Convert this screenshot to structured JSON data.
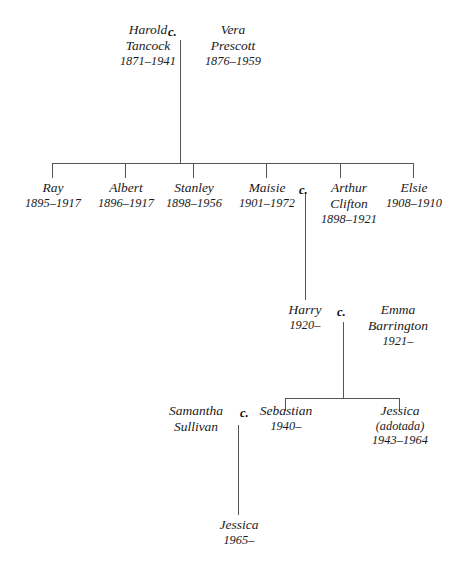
{
  "diagram": {
    "line_color": "#555555",
    "text_color": "#1a1a1a",
    "background": "#ffffff",
    "marriage_symbol": "c."
  },
  "generations": {
    "gen1": [
      {
        "name": "Harold",
        "surname": "Tancock",
        "dates": "1871–1941"
      },
      {
        "name": "Vera",
        "surname": "Prescott",
        "dates": "1876–1959"
      }
    ],
    "gen2": [
      {
        "name": "Ray",
        "dates": "1895–1917"
      },
      {
        "name": "Albert",
        "dates": "1896–1917"
      },
      {
        "name": "Stanley",
        "dates": "1898–1956"
      },
      {
        "name": "Maisie",
        "dates": "1901–1972"
      },
      {
        "name": "Arthur",
        "surname": "Clifton",
        "dates": "1898–1921"
      },
      {
        "name": "Elsie",
        "dates": "1908–1910"
      }
    ],
    "gen3": [
      {
        "name": "Harry",
        "dates": "1920–"
      },
      {
        "name": "Emma",
        "surname": "Barrington",
        "dates": "1921–"
      }
    ],
    "gen4": [
      {
        "name": "Samantha",
        "surname": "Sullivan",
        "dates": ""
      },
      {
        "name": "Sebastian",
        "dates": "1940–"
      },
      {
        "name": "Jessica",
        "note": "(adotada)",
        "dates": "1943–1964"
      }
    ],
    "gen5": [
      {
        "name": "Jessica",
        "dates": "1965–"
      }
    ]
  },
  "marriage_marks": {
    "harold_vera": "c.",
    "maisie_arthur": "c.",
    "harry_emma": "c.",
    "samantha_sebastian": "c."
  }
}
